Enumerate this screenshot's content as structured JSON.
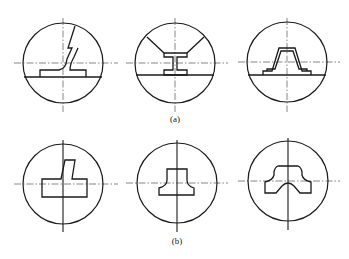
{
  "figure": {
    "row_a": {
      "label": "(a)",
      "panels": [
        {
          "name": "tee-weld-inclined-plate",
          "description": "T-joint with inclined plate"
        },
        {
          "name": "i-beam-section",
          "description": "I-beam with diagonal cut lines"
        },
        {
          "name": "hat-profile",
          "description": "Hat-shaped profile on base plate"
        }
      ]
    },
    "row_b": {
      "label": "(b)",
      "panels": [
        {
          "name": "offset-tee-section",
          "description": "Offset T block section"
        },
        {
          "name": "fillet-tee-section",
          "description": "Inverted T with fillets"
        },
        {
          "name": "notched-tee-section",
          "description": "T section with bottom notch"
        }
      ]
    },
    "colors": {
      "line": "#1a1a1a",
      "centerline": "#555555",
      "background": "#ffffff"
    }
  }
}
